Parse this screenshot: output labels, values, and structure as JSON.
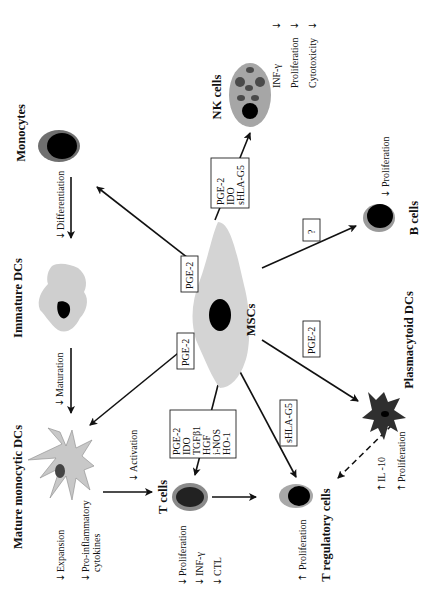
{
  "center": {
    "label": "MSCs",
    "color_body": "#d4d4d4",
    "color_nucleus": "#000000"
  },
  "cells": {
    "nk": {
      "title": "NK cells",
      "effects": [
        {
          "dir": "down",
          "text": "INF-γ"
        },
        {
          "dir": "down",
          "text": "Proliferation"
        },
        {
          "dir": "down",
          "text": "Cytotoxicity"
        }
      ]
    },
    "monocytes": {
      "title": "Monocytes",
      "effects": [
        {
          "dir": "down",
          "text": "Differentiation"
        }
      ]
    },
    "immature_dcs": {
      "title": "Immature DCs",
      "effects": [
        {
          "dir": "down",
          "text": "Maturation"
        }
      ]
    },
    "mature_dcs": {
      "title": "Mature monocytic DCs",
      "effects": [
        {
          "dir": "down",
          "text": "Expansion"
        },
        {
          "dir": "down",
          "text": "Pro-inflammatory"
        },
        {
          "dir": "",
          "text": "cytokines"
        },
        {
          "dir": "down",
          "text": "Activation"
        }
      ]
    },
    "t_cells": {
      "title": "T cells",
      "effects": [
        {
          "dir": "down",
          "text": "Proliferation"
        },
        {
          "dir": "down",
          "text": "INF-γ"
        },
        {
          "dir": "down",
          "text": "CTL"
        }
      ]
    },
    "treg": {
      "title": "T regulatory cells",
      "effects": [
        {
          "dir": "up",
          "text": "Proliferation"
        }
      ]
    },
    "pdcs": {
      "title": "Plasmacytoid DCs",
      "effects": [
        {
          "dir": "up",
          "text": "IL -10"
        },
        {
          "dir": "up",
          "text": "Proliferation"
        }
      ]
    },
    "b_cells": {
      "title": "B cells",
      "effects": [
        {
          "dir": "down",
          "text": "Proliferation"
        }
      ]
    }
  },
  "mediators": {
    "nk": [
      "PGE-2",
      "IDO",
      "sHLA-G5"
    ],
    "monocytes": [
      "PGE-2"
    ],
    "mature_dcs": [
      "PGE-2"
    ],
    "t_cells": [
      "PGE-2",
      "IDO",
      "TGFβ1",
      "HGF",
      "i-NOS",
      "HO-1"
    ],
    "treg": [
      "sHLA-G5"
    ],
    "pdcs": [
      "PGE-2"
    ],
    "b_cells": [
      "?"
    ]
  },
  "arrow_glyphs": {
    "down": "↓",
    "up": "↑"
  }
}
